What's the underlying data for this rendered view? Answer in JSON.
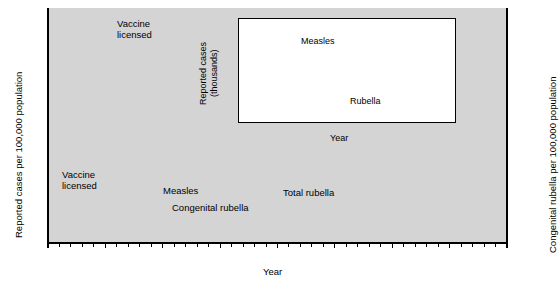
{
  "figure": {
    "main_axis": {
      "ylabel_left": "Reported cases per 100,000 population",
      "ylabel_right": "Congenital rubella per 100,000 population",
      "xlabel": "Year",
      "xticks": [
        "1960",
        "1965",
        "1970",
        "1975",
        "1980",
        "1985",
        "1990",
        "1995",
        "2000"
      ],
      "yticks_left": [
        "0",
        "5",
        "10",
        "15",
        "20",
        "25",
        "30"
      ],
      "yticks_right": [
        "0",
        "2",
        "4",
        "6",
        "8",
        "10",
        "12",
        "14"
      ]
    },
    "inset_axis": {
      "ylabel": "Reported cases (thousands)",
      "ylabel_line1": "Reported cases",
      "ylabel_line2": "(thousands)",
      "xlabel": "Year",
      "xticks": [
        "1980",
        "1985",
        "1990",
        "1995",
        "2000"
      ],
      "yticks": [
        "0",
        "4",
        "8",
        "12",
        "16",
        "20",
        "24",
        "28",
        "32"
      ]
    },
    "annotations": {
      "vaccine_licensed_top_line1": "Vaccine",
      "vaccine_licensed_top_line2": "licensed",
      "vaccine_licensed_low_line1": "Vaccine",
      "vaccine_licensed_low_line2": "licensed",
      "measles_main": "Measles",
      "total_rubella": "Total rubella",
      "congenital_rubella": "Congenital rubella",
      "measles_inset": "Measles",
      "rubella_inset": "Rubella"
    },
    "colors": {
      "plot_background": "#d4d4d4",
      "inset_background": "#ffffff",
      "measles_line": "#3f3f3f",
      "total_rubella_line": "#8a8a8a",
      "congenital_rubella_line": "#222222",
      "axis": "#000000"
    }
  },
  "chart_data": [
    {
      "type": "line",
      "id": "main",
      "title": "",
      "xlabel": "Year",
      "ylabel": "Reported cases per 100,000 population",
      "ylabel_secondary": "Congenital rubella per 100,000 population",
      "xlim": [
        1960,
        2000
      ],
      "ylim": [
        0,
        32
      ],
      "ylim_secondary": [
        0,
        15.2
      ],
      "grid": false,
      "legend": "inline-annotations",
      "series": [
        {
          "name": "Measles",
          "color": "#3f3f3f",
          "axis": "left",
          "x": [
            1960,
            1961,
            1962,
            1963,
            1964,
            1965,
            1966,
            1967,
            1968,
            1969,
            1970,
            1971,
            1972,
            1973,
            1974,
            1975,
            1976,
            1977,
            1978,
            1979,
            1980,
            1981,
            1982,
            1983,
            1984,
            1985,
            1986,
            1987,
            1988,
            1989,
            1990,
            1991,
            1992,
            1993,
            1994,
            1995,
            1996,
            1997,
            1998,
            1999,
            2000
          ],
          "y": [
            4.8,
            4.3,
            4.6,
            5.4,
            4.1,
            4.5,
            4.2,
            3.6,
            3.1,
            2.5,
            1.8,
            1.2,
            0.55,
            0.55,
            0.7,
            0.75,
            0.5,
            0.55,
            0.9,
            0.75,
            0.6,
            0.25,
            0.1,
            0.08,
            0.1,
            0.1,
            0.25,
            0.15,
            0.15,
            0.7,
            1.1,
            0.4,
            0.1,
            0.05,
            0.04,
            0.03,
            0.02,
            0.02,
            0.02,
            0.02,
            0.02
          ]
        },
        {
          "name": "Total rubella",
          "color": "#8a8a8a",
          "axis": "left",
          "x": [
            1966,
            1967,
            1968,
            1969,
            1970,
            1971,
            1972,
            1973,
            1974,
            1975,
            1976,
            1977,
            1978,
            1979,
            1980,
            1981,
            1982,
            1983,
            1984,
            1985,
            1986,
            1987,
            1988,
            1989,
            1990,
            1991,
            1992,
            1993,
            1994,
            1995,
            1996,
            1997,
            1998,
            1999,
            2000
          ],
          "y": [
            24.0,
            24.1,
            28.9,
            28.0,
            27.8,
            21.0,
            12.8,
            14.5,
            5.8,
            8.0,
            5.9,
            9.1,
            9.7,
            8.3,
            1.7,
            0.9,
            0.85,
            0.4,
            0.3,
            0.25,
            0.3,
            0.5,
            0.3,
            0.2,
            0.5,
            0.55,
            0.2,
            0.08,
            0.09,
            0.05,
            0.09,
            0.07,
            0.05,
            0.1,
            0.07
          ]
        },
        {
          "name": "Congenital rubella",
          "color": "#222222",
          "axis": "right",
          "x": [
            1969,
            1970,
            1971,
            1972,
            1973,
            1974,
            1975,
            1976,
            1977,
            1978,
            1979,
            1980,
            1981,
            1982,
            1983,
            1984,
            1985,
            1986,
            1987,
            1988,
            1989,
            1990,
            1991,
            1992,
            1993,
            1994,
            1995,
            1996,
            1997,
            1998,
            1999,
            2000
          ],
          "y": [
            3.9,
            4.1,
            3.1,
            3.3,
            2.2,
            2.9,
            2.0,
            2.4,
            1.5,
            2.2,
            2.1,
            1.5,
            2.0,
            1.7,
            1.4,
            1.45,
            3.6,
            1.3,
            0.15,
            0.2,
            0.2,
            0.45,
            0.3,
            0.2,
            0.1,
            0.1,
            0.08,
            0.08,
            0.06,
            0.06,
            0.06,
            0.06
          ]
        }
      ],
      "annotations": [
        {
          "text": "Vaccine licensed",
          "points_to_year": 1969,
          "points_to_value": 28.9,
          "series": "Total rubella"
        },
        {
          "text": "Vaccine licensed",
          "points_to_year": 1963,
          "points_to_value": 4.0,
          "series": "Measles"
        }
      ]
    },
    {
      "type": "line",
      "id": "inset",
      "title": "",
      "xlabel": "Year",
      "ylabel": "Reported cases (thousands)",
      "xlim": [
        1980,
        2000
      ],
      "ylim": [
        0,
        32
      ],
      "grid": false,
      "legend": "inline-annotations",
      "series": [
        {
          "name": "Measles",
          "color": "#3f3f3f",
          "x": [
            1980,
            1981,
            1982,
            1983,
            1984,
            1985,
            1986,
            1987,
            1988,
            1989,
            1990,
            1991,
            1992,
            1993,
            1994,
            1995,
            1996,
            1997,
            1998,
            1999,
            2000
          ],
          "y": [
            12.2,
            3.1,
            1.7,
            1.5,
            2.6,
            2.8,
            6.3,
            3.6,
            3.4,
            18.2,
            27.8,
            9.6,
            2.2,
            0.3,
            1.0,
            5.0,
            0.5,
            0.15,
            0.1,
            0.1,
            0.08
          ]
        },
        {
          "name": "Rubella",
          "color": "#8a8a8a",
          "x": [
            1980,
            1981,
            1982,
            1983,
            1984,
            1985,
            1986,
            1987,
            1988,
            1989,
            1990,
            1991,
            1992,
            1993,
            1994,
            1995,
            1996,
            1997,
            1998,
            1999,
            2000
          ],
          "y": [
            3.9,
            2.1,
            2.3,
            1.0,
            0.75,
            0.63,
            0.55,
            0.31,
            0.23,
            0.4,
            1.1,
            1.4,
            0.16,
            0.19,
            0.23,
            0.13,
            0.24,
            0.18,
            0.36,
            0.27,
            0.18
          ]
        }
      ]
    }
  ]
}
